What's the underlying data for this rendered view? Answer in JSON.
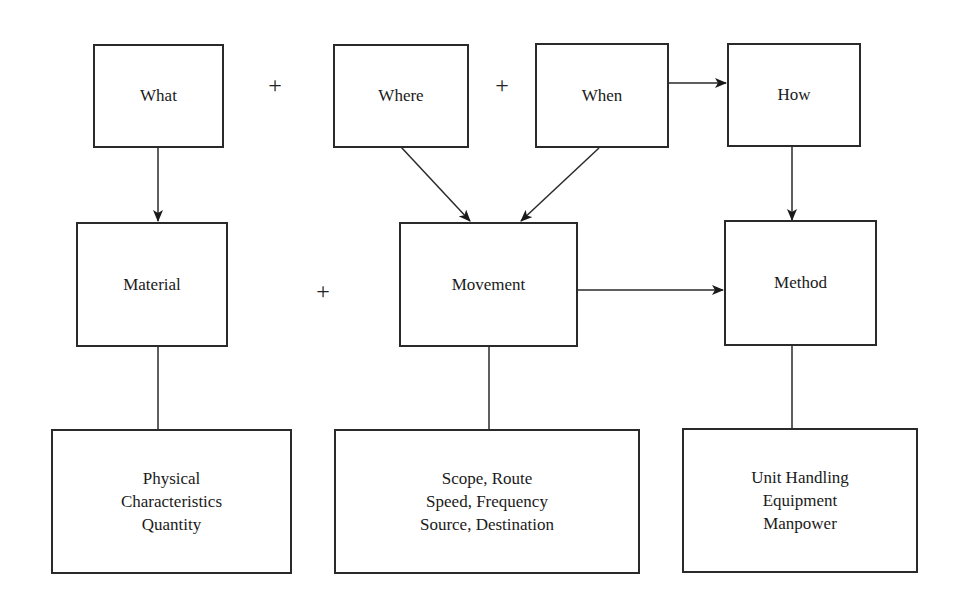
{
  "diagram": {
    "top_row": [
      {
        "id": "what",
        "label": "What"
      },
      {
        "id": "where",
        "label": "Where"
      },
      {
        "id": "when",
        "label": "When"
      },
      {
        "id": "how",
        "label": "How"
      }
    ],
    "middle_row": [
      {
        "id": "material",
        "label": "Material"
      },
      {
        "id": "movement",
        "label": "Movement"
      },
      {
        "id": "method",
        "label": "Method"
      }
    ],
    "bottom_row": [
      {
        "id": "material-details",
        "lines": [
          "Physical",
          "Characteristics",
          "Quantity"
        ]
      },
      {
        "id": "movement-details",
        "lines": [
          "Scope, Route",
          "Speed, Frequency",
          "Source, Destination"
        ]
      },
      {
        "id": "method-details",
        "lines": [
          "Unit Handling",
          "Equipment",
          "Manpower"
        ]
      }
    ],
    "operators": {
      "what_where": "+",
      "where_when": "+",
      "material_movement": "+"
    },
    "connections": [
      {
        "from": "What",
        "to": "Material",
        "type": "arrow"
      },
      {
        "from": "Where",
        "to": "Movement",
        "type": "arrow"
      },
      {
        "from": "When",
        "to": "Movement",
        "type": "arrow"
      },
      {
        "from": "When",
        "to": "How",
        "type": "arrow"
      },
      {
        "from": "How",
        "to": "Method",
        "type": "arrow"
      },
      {
        "from": "Movement",
        "to": "Method",
        "type": "arrow"
      },
      {
        "from": "Material",
        "to": "Physical Characteristics Quantity",
        "type": "line"
      },
      {
        "from": "Movement",
        "to": "Scope, Route / Speed, Frequency / Source, Destination",
        "type": "line"
      },
      {
        "from": "Method",
        "to": "Unit Handling / Equipment / Manpower",
        "type": "line"
      }
    ]
  }
}
